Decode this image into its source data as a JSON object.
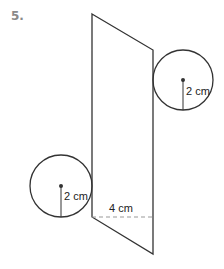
{
  "problem": {
    "number": "5."
  },
  "figure": {
    "type": "cylinder-net",
    "parallelogram": {
      "points": [
        [
          92,
          14
        ],
        [
          153,
          50
        ],
        [
          153,
          254
        ],
        [
          92,
          217
        ]
      ]
    },
    "circles": [
      {
        "name": "top-right-circle",
        "cx": 183,
        "cy": 80,
        "r": 30,
        "radius_label": "2 cm"
      },
      {
        "name": "bottom-left-circle",
        "cx": 61,
        "cy": 186,
        "r": 31,
        "radius_label": "2 cm"
      }
    ],
    "height_line": {
      "x1": 92,
      "x2": 153,
      "y": 217,
      "label": "4 cm"
    },
    "colors": {
      "stroke": "#333333",
      "dash": "#999999",
      "text": "#222222",
      "number": "#8a8a8a"
    }
  }
}
